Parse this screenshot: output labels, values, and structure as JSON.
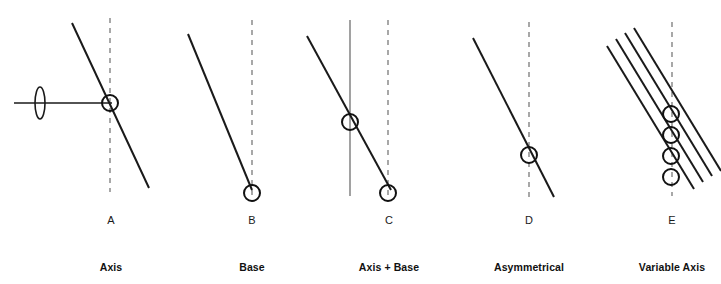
{
  "figure": {
    "width": 721,
    "height": 284,
    "background": "#ffffff",
    "stroke_color": "#1a1a1a",
    "dashed_color": "#6e6e6e",
    "thin_color": "#555555"
  },
  "panels": [
    {
      "letter": "A",
      "caption": "Axis",
      "letter_x": 111,
      "letter_y": 222,
      "caption_x": 111,
      "caption_y": 268,
      "elements": [
        "horizontal-line",
        "lens-symbol",
        "dashed-vertical-axis",
        "diagonal-line",
        "intersection-circle"
      ],
      "dashed_axis": {
        "x": 110,
        "y1": 18,
        "y2": 192
      },
      "diagonal": {
        "x1": 72,
        "y1": 23,
        "x2": 149,
        "y2": 188
      },
      "horizontal": {
        "x1": 14,
        "y": 103,
        "x2": 112
      },
      "lens": {
        "cx": 40,
        "cy": 103,
        "rx": 5,
        "ry": 16
      },
      "circles": [
        {
          "cx": 110,
          "cy": 103,
          "r": 8
        }
      ]
    },
    {
      "letter": "B",
      "caption": "Base",
      "letter_x": 252,
      "letter_y": 222,
      "caption_x": 252,
      "caption_y": 268,
      "elements": [
        "dashed-vertical-axis",
        "diagonal-line",
        "base-circle"
      ],
      "dashed_axis": {
        "x": 252,
        "y1": 20,
        "y2": 196
      },
      "diagonal": {
        "x1": 188,
        "y1": 34,
        "x2": 252,
        "y2": 190
      },
      "circles": [
        {
          "cx": 252,
          "cy": 193,
          "r": 8
        }
      ]
    },
    {
      "letter": "C",
      "caption": "Axis + Base",
      "letter_x": 389,
      "letter_y": 222,
      "caption_x": 389,
      "caption_y": 268,
      "elements": [
        "solid-vertical-axis",
        "dashed-vertical-axis",
        "diagonal-line",
        "axis-circle",
        "base-circle"
      ],
      "solid_axis": {
        "x": 350,
        "y1": 20,
        "y2": 196
      },
      "dashed_axis": {
        "x": 388,
        "y1": 20,
        "y2": 196
      },
      "diagonal": {
        "x1": 307,
        "y1": 36,
        "x2": 391,
        "y2": 190
      },
      "circles": [
        {
          "cx": 350,
          "cy": 122,
          "r": 8
        },
        {
          "cx": 388,
          "cy": 193,
          "r": 8
        }
      ]
    },
    {
      "letter": "D",
      "caption": "Asymmetrical",
      "letter_x": 529,
      "letter_y": 222,
      "caption_x": 529,
      "caption_y": 268,
      "elements": [
        "dashed-vertical-axis",
        "diagonal-line",
        "intersection-circle"
      ],
      "dashed_axis": {
        "x": 529,
        "y1": 22,
        "y2": 198
      },
      "diagonal": {
        "x1": 473,
        "y1": 38,
        "x2": 554,
        "y2": 197
      },
      "circles": [
        {
          "cx": 529,
          "cy": 155,
          "r": 8
        }
      ]
    },
    {
      "letter": "E",
      "caption": "Variable Axis",
      "letter_x": 672,
      "letter_y": 222,
      "caption_x": 672,
      "caption_y": 268,
      "elements": [
        "dashed-vertical-axis",
        "diagonal-line-1",
        "diagonal-line-2",
        "diagonal-line-3",
        "diagonal-line-4",
        "intersection-circles"
      ],
      "dashed_axis": {
        "x": 672,
        "y1": 22,
        "y2": 196
      },
      "diagonals": [
        {
          "x1": 607,
          "y1": 46,
          "x2": 694,
          "y2": 189
        },
        {
          "x1": 616,
          "y1": 39,
          "x2": 703,
          "y2": 182
        },
        {
          "x1": 625,
          "y1": 33,
          "x2": 712,
          "y2": 176
        },
        {
          "x1": 634,
          "y1": 28,
          "x2": 721,
          "y2": 171
        }
      ],
      "circles": [
        {
          "cx": 671,
          "cy": 177,
          "r": 8
        },
        {
          "cx": 671,
          "cy": 156,
          "r": 8
        },
        {
          "cx": 671,
          "cy": 135,
          "r": 8
        },
        {
          "cx": 671,
          "cy": 114,
          "r": 8
        }
      ]
    }
  ]
}
